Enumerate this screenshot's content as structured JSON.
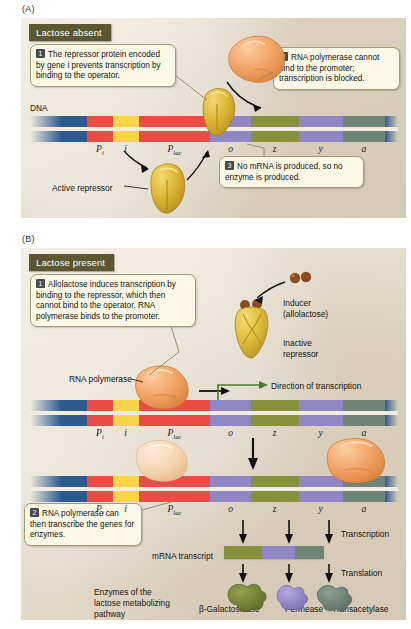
{
  "figure": {
    "panelA_letter": "(A)",
    "panelB_letter": "(B)"
  },
  "panelA": {
    "header": "Lactose absent",
    "dna_label": "DNA",
    "active_repressor_label": "Active repressor",
    "callouts": [
      {
        "num": "1",
        "text": "The repressor protein encoded by gene i prevents transcription by binding to the operator."
      },
      {
        "num": "2",
        "text": "RNA polymerase cannot bind to the promoter; transcription is blocked."
      },
      {
        "num": "3",
        "text": "No mRNA is produced, so no enzyme is produced."
      }
    ]
  },
  "panelB": {
    "header": "Lactose present",
    "callouts": [
      {
        "num": "1",
        "text": "Allolactose induces transcription by binding to the repressor, which then cannot bind to the operator. RNA polymerase binds to the promoter."
      },
      {
        "num": "2",
        "text": "RNA polymerase can then transcribe the genes for enzymes."
      }
    ],
    "inducer_label_line1": "Inducer",
    "inducer_label_line2": "(allolactose)",
    "inactive_repressor_line1": "Inactive",
    "inactive_repressor_line2": "repressor",
    "rna_polymerase_label": "RNA polymerase",
    "direction_label": "Direction of transcription",
    "transcription_label": "Transcription",
    "translation_label": "Translation",
    "mrna_label": "mRNA transcript",
    "enzymes_caption_line1": "Enzymes of the",
    "enzymes_caption_line2": "lactose metabolizing",
    "enzymes_caption_line3": "pathway",
    "enzymes": [
      "β-Galactosidase",
      "Permease",
      "Transacetylase"
    ]
  },
  "gene_map": {
    "labels": [
      "P",
      "i",
      "P",
      "o",
      "z",
      "y",
      "a"
    ],
    "label_subs": [
      "i",
      "",
      "lac",
      "",
      "",
      "",
      ""
    ],
    "segments": [
      {
        "name": "flank-left",
        "color": "#2d5a8e",
        "width": 15.5
      },
      {
        "name": "Pi",
        "color": "#ea4b45",
        "width": 7.0
      },
      {
        "name": "i",
        "color": "#f7d44c",
        "width": 7.0
      },
      {
        "name": "Plac",
        "color": "#ea4b45",
        "width": 19.5
      },
      {
        "name": "o",
        "color": "#9186c4",
        "width": 11.0
      },
      {
        "name": "z",
        "color": "#87903a",
        "width": 13.0
      },
      {
        "name": "y",
        "color": "#9186c4",
        "width": 12.0
      },
      {
        "name": "a",
        "color": "#6f8477",
        "width": 11.5
      },
      {
        "name": "flank-right",
        "color": "#2d5a8e",
        "width": 3.5
      }
    ]
  },
  "mrna_segments": [
    {
      "name": "z-transcript",
      "color": "#87903a",
      "width": 38
    },
    {
      "name": "y-transcript",
      "color": "#9186c4",
      "width": 33
    },
    {
      "name": "a-transcript",
      "color": "#6f8477",
      "width": 29
    }
  ],
  "colors": {
    "panel_background": "#e6dfd0",
    "header_bar": "#5a5731",
    "callout_fill": "#fbf8e6",
    "callout_border": "#a49a74",
    "repressor": "#d7b02e",
    "inactive_repressor": "#e0bc3c",
    "rna_polymerase": "#ef9d5e",
    "rna_polymerase_pale": "#f3d3ad",
    "inducer": "#8a4a22",
    "arrow": "#111111",
    "transcription_arrow": "#4e7a2f",
    "beta_galactosidase": "#6b7a33",
    "permease": "#9186c4",
    "transacetylase": "#6f8477"
  }
}
